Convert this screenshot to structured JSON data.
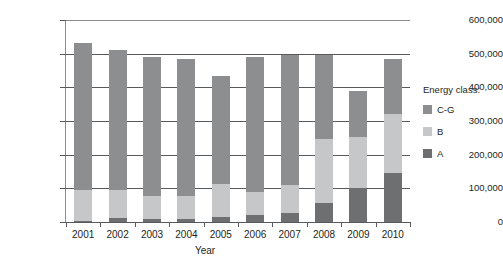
{
  "chart_data": {
    "type": "bar",
    "subtype": "stacked-bar",
    "title": "",
    "xlabel": "Year",
    "ylabel": "",
    "categories": [
      "2001",
      "2002",
      "2003",
      "2004",
      "2005",
      "2006",
      "2007",
      "2008",
      "2009",
      "2010"
    ],
    "ylim": [
      0,
      600000
    ],
    "ytick_values": [
      0,
      100000,
      200000,
      300000,
      400000,
      500000,
      600000
    ],
    "ytick_labels": [
      "0",
      "100,000",
      "200,000",
      "300,000",
      "400,000",
      "500,000",
      "600,000"
    ],
    "grid": true,
    "legend_position": "right",
    "legend_title": "Energy class:",
    "stack_order_bottom_to_top": [
      "A",
      "B",
      "C-G"
    ],
    "series": [
      {
        "name": "A",
        "color": "#6e6f71",
        "values": [
          2000,
          13000,
          10000,
          10000,
          14000,
          20000,
          27000,
          57000,
          100000,
          145000
        ]
      },
      {
        "name": "B",
        "color": "#c6c7c8",
        "values": [
          92000,
          82000,
          68000,
          66000,
          100000,
          70000,
          82000,
          190000,
          153000,
          175000
        ]
      },
      {
        "name": "C-G",
        "color": "#8d8e90",
        "values": [
          439000,
          415000,
          412000,
          408000,
          319000,
          400000,
          388000,
          250000,
          135000,
          163000
        ]
      }
    ],
    "totals": [
      533000,
      510000,
      490000,
      484000,
      433000,
      490000,
      497000,
      497000,
      388000,
      483000
    ]
  },
  "legend": {
    "title": "Energy class:",
    "items": [
      {
        "label": "C-G",
        "color": "#8d8e90"
      },
      {
        "label": "B",
        "color": "#c6c7c8"
      },
      {
        "label": "A",
        "color": "#6e6f71"
      }
    ]
  },
  "axes": {
    "x_title": "Year"
  }
}
